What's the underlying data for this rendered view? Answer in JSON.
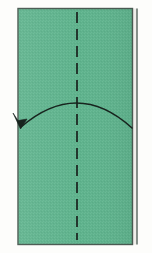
{
  "figure": {
    "title": "Paper folding step diagram",
    "canvas": {
      "width": 152,
      "height": 253
    },
    "background_color": "#fdfdfb"
  },
  "paper": {
    "name": "paper-sheet",
    "shape": "rectangle",
    "fill_color": "#5fb28d",
    "fill_color_alt": "#69b895",
    "texture": "dithered-speckle",
    "outline_color": "#4a5a52",
    "outline_width": 1.4,
    "x": 18,
    "y": 8.5,
    "width": 114.5,
    "height": 236,
    "right_edge_highlight_color": "#efeeea"
  },
  "folded_edge": {
    "name": "folded-back-edge",
    "description": "Thin second vertical line just right of the sheet showing the far folded edge",
    "color": "#4a5a52",
    "x": 137.0,
    "y_top": 8.5,
    "y_bottom": 244.5,
    "width": 1.3
  },
  "crease_line": {
    "name": "center-crease-dashed-line",
    "style": "dashed",
    "orientation": "vertical",
    "color": "#1d2a24",
    "width": 1.8,
    "x": 77,
    "y_top": 12,
    "y_bottom": 240,
    "dash_length": 11,
    "gap_length": 6
  },
  "fold_arrow": {
    "name": "fold-direction-arrow",
    "description": "Curved arc arrow from right edge, arcing up over the middle, pointing down-left to the left edge",
    "color": "#17241e",
    "stroke_width": 1.6,
    "start_x": 132,
    "start_y": 128,
    "apex_x": 77,
    "apex_y": 103,
    "end_x": 21,
    "end_y": 127,
    "arrowhead": {
      "name": "arrowhead",
      "type": "barbed-v",
      "tip_x": 20.5,
      "tip_y": 129,
      "length": 17,
      "spread": 13
    }
  }
}
